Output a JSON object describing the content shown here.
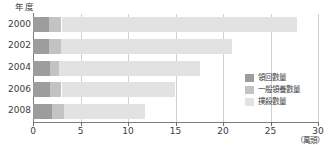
{
  "chart_data": {
    "type": "bar",
    "orientation": "horizontal",
    "stacked": true,
    "title": "",
    "xlabel": "（萬頭）",
    "ylabel": "年度",
    "categories": [
      "2000",
      "2002",
      "2004",
      "2006",
      "2008"
    ],
    "xticks": [
      "0",
      "5",
      "10",
      "15",
      "20",
      "25",
      "30"
    ],
    "xlim": [
      0,
      30
    ],
    "grid": true,
    "legend_position": "inside-right",
    "series": [
      {
        "name": "領回數量",
        "color": "#9d9d9d",
        "values": [
          1.7,
          1.7,
          1.8,
          1.8,
          2.0
        ]
      },
      {
        "name": "一般領養數量",
        "color": "#c3c3c3",
        "values": [
          1.3,
          1.2,
          0.9,
          1.2,
          1.3
        ]
      },
      {
        "name": "撲殺數量",
        "color": "#e2e2e2",
        "values": [
          24.8,
          18.1,
          14.9,
          11.9,
          8.5
        ]
      }
    ],
    "totals": [
      27.8,
      21.0,
      17.6,
      14.9,
      11.8
    ]
  },
  "legend": {
    "items": [
      {
        "label": "領回數量"
      },
      {
        "label": "一般領養數量"
      },
      {
        "label": "撲殺數量"
      }
    ]
  },
  "axes": {
    "y_axis_title": "年度",
    "x_axis_unit": "（萬頭）"
  }
}
